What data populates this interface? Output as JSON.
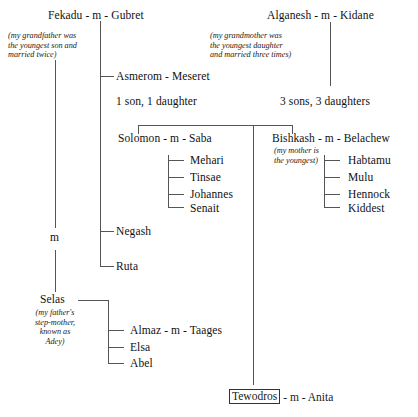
{
  "diagram": {
    "line_color": "#555555",
    "text_color": "#111111",
    "background": "#ffffff"
  },
  "people": {
    "fekadu_gubret": "Fekadu - m - Gubret",
    "alganesh_kidane": "Alganesh - m - Kidane",
    "asmerom_meseret": "Asmerom - Meseret",
    "solomon_saba": "Solomon - m - Saba",
    "bishkash_belachew": "Bishkash - m - Belachew",
    "mehari": "Mehari",
    "tinsae": "Tinsae",
    "johannes": "Johannes",
    "senait": "Senait",
    "habtamu": "Habtamu",
    "mulu": "Mulu",
    "hennock": "Hennock",
    "kiddest": "Kiddest",
    "negash": "Negash",
    "ruta": "Ruta",
    "selas": "Selas",
    "almaz_taages": "Almaz - m - Taages",
    "elsa": "Elsa",
    "abel": "Abel",
    "tewodros": "Tewodros",
    "tewodros_suffix": "- m - Anita"
  },
  "notes": {
    "grandfather": "(my grandfather was\nthe youngest son and\nmarried twice)",
    "grandmother": "(my grandmother was\nthe youngest daughter\nand married three times)",
    "mother_youngest": "(my mother is\nthe youngest)",
    "step_mother": "(my father's\nstep-mother,\nknown as\nAdey)"
  },
  "labels": {
    "one_son_one_daughter": "1 son, 1 daughter",
    "three_sons_three_daughters": "3 sons, 3 daughters",
    "second_marriage_marker": "m"
  }
}
